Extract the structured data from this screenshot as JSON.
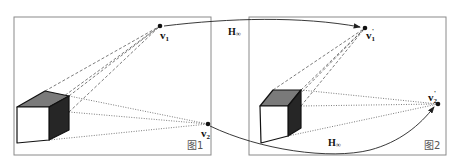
{
  "figure": {
    "panels": [
      {
        "id": "left",
        "caption": "图1",
        "frame": {
          "x": 14,
          "y": 17,
          "w": 197,
          "h": 138
        }
      },
      {
        "id": "right",
        "caption": "图2",
        "frame": {
          "x": 249,
          "y": 17,
          "w": 197,
          "h": 138
        }
      }
    ],
    "points": {
      "v1": {
        "label": "v",
        "sub": "1",
        "sup": "",
        "x": 160,
        "y": 26
      },
      "v2": {
        "label": "v",
        "sub": "2",
        "sup": "",
        "x": 208,
        "y": 124
      },
      "v1p": {
        "label": "v",
        "sub": "1",
        "sup": "'",
        "x": 365,
        "y": 28
      },
      "v2p": {
        "label": "v",
        "sub": "2",
        "sup": "'",
        "x": 438,
        "y": 104
      }
    },
    "mappings": [
      {
        "label": "H",
        "sub": "∞",
        "from": "v1",
        "to": "v1p"
      },
      {
        "label": "H",
        "sub": "∞",
        "from": "v2",
        "to": "v2p"
      }
    ],
    "colors": {
      "frame": "#888888",
      "cube_top": "#7a7a7a",
      "cube_side": "#262626",
      "cube_front": "#ffffff",
      "lines": "#333333"
    }
  }
}
